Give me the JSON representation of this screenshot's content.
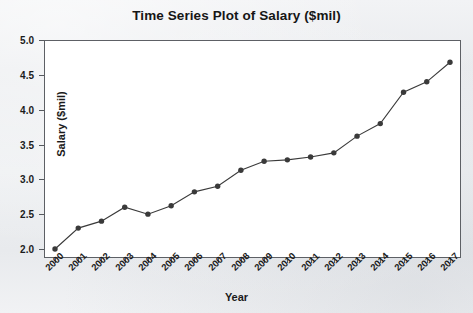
{
  "chart_data": {
    "type": "line",
    "title": "Time Series Plot of Salary ($mil)",
    "xlabel": "Year",
    "ylabel": "Salary ($mil)",
    "categories": [
      "2000",
      "2001",
      "2002",
      "2003",
      "2004",
      "2005",
      "2006",
      "2007",
      "2008",
      "2009",
      "2010",
      "2011",
      "2012",
      "2013",
      "2014",
      "2015",
      "2016",
      "2017"
    ],
    "values": [
      2.0,
      2.3,
      2.4,
      2.6,
      2.5,
      2.62,
      2.82,
      2.9,
      3.13,
      3.26,
      3.28,
      3.32,
      3.38,
      3.62,
      3.8,
      4.25,
      4.4,
      4.68
    ],
    "ylim": [
      2.0,
      5.0
    ],
    "yticks": [
      "2.0",
      "2.5",
      "3.0",
      "3.5",
      "4.0",
      "4.5",
      "5.0"
    ],
    "ytick_values": [
      2.0,
      2.5,
      3.0,
      3.5,
      4.0,
      4.5,
      5.0
    ],
    "grid": false,
    "legend": "none",
    "series_color": "#3a3a3a",
    "marker": "filled-circle",
    "plot_background": "#ffffff",
    "page_background": "#eceef1"
  }
}
